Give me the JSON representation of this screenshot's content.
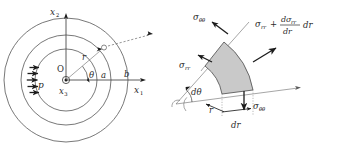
{
  "figure": {
    "background_color": "#ffffff",
    "ink_color": "#2b2b2b",
    "element_fill": "#c9c9c9"
  },
  "left_diagram": {
    "name": "thick-walled-cylinder-cross-section",
    "axes": {
      "vertical_label": "x",
      "vertical_sub": "2",
      "horizontal_label": "x",
      "horizontal_sub": "1",
      "out_of_plane_label": "x",
      "out_of_plane_sub": "3"
    },
    "origin_label": "O",
    "pressure_label": "p",
    "pressure_arrow_count": 5,
    "radius_label": "r",
    "angle_label": "θ",
    "inner_radius_label": "a",
    "outer_radius_label": "b",
    "circles": [
      {
        "name": "inner-bore-circle",
        "radius_label": "a"
      },
      {
        "name": "material-point-circle",
        "radius_label": "r"
      },
      {
        "name": "outer-surface-circle",
        "radius_label": "b"
      }
    ]
  },
  "right_diagram": {
    "name": "polar-stress-element-free-body",
    "radius_label": "r",
    "radial_thickness_label": "dr",
    "angle_increment_label": "dθ",
    "stresses": [
      {
        "name": "hoop-stress-top",
        "label": "σ",
        "sub": "θθ"
      },
      {
        "name": "hoop-stress-bottom",
        "label": "σ",
        "sub": "θθ"
      },
      {
        "name": "radial-stress-inner",
        "label": "σ",
        "sub": "rr"
      },
      {
        "name": "radial-stress-outer",
        "label": "σ",
        "sub": "rr"
      }
    ],
    "radial_stress_outer_expression": {
      "base": "σ",
      "base_sub": "rr",
      "plus": "+",
      "numerator": "dσ",
      "numerator_sub": "rr",
      "denominator": "dr",
      "trailing": "dr"
    }
  }
}
